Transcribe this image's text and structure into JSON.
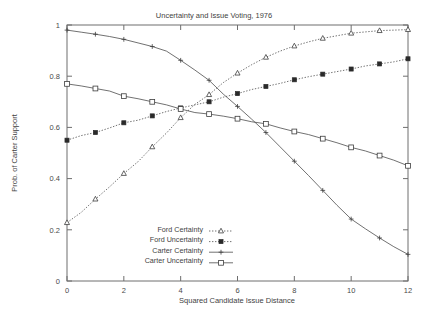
{
  "chart_data": {
    "type": "line",
    "title": "Uncertainty and Issue Voting, 1976",
    "xlabel": "Squared Candidate Issue Distance",
    "ylabel": "Prob. of Carter Support",
    "xlim": [
      0,
      12
    ],
    "ylim": [
      0,
      1
    ],
    "xticks": [
      0,
      2,
      4,
      6,
      8,
      10,
      12
    ],
    "xticklabels": [
      "0",
      "2",
      "4",
      "6",
      "8",
      "10",
      "12"
    ],
    "yticks": [
      0,
      0.2,
      0.4,
      0.6,
      0.8,
      1
    ],
    "yticklabels": [
      "0",
      "0.2",
      "0.4",
      "0.6",
      "0.8",
      "1"
    ],
    "grid": false,
    "legend_position": "lower-center-left",
    "x": [
      0,
      0.5,
      1,
      1.5,
      2,
      2.5,
      3,
      3.5,
      4,
      4.5,
      5,
      5.5,
      6,
      6.5,
      7,
      7.5,
      8,
      8.5,
      9,
      9.5,
      10,
      10.5,
      11,
      11.5,
      12
    ],
    "series": [
      {
        "name": "Ford Certainty",
        "marker": "open-triangle",
        "linestyle": "dotted",
        "values": [
          0.228,
          0.268,
          0.32,
          0.368,
          0.42,
          0.466,
          0.524,
          0.578,
          0.638,
          0.69,
          0.728,
          0.775,
          0.812,
          0.845,
          0.874,
          0.898,
          0.918,
          0.934,
          0.948,
          0.958,
          0.968,
          0.973,
          0.978,
          0.98,
          0.982
        ]
      },
      {
        "name": "Ford Uncertainty",
        "marker": "filled-square",
        "linestyle": "dotted",
        "values": [
          0.55,
          0.568,
          0.58,
          0.598,
          0.618,
          0.628,
          0.645,
          0.662,
          0.676,
          0.688,
          0.7,
          0.718,
          0.732,
          0.748,
          0.76,
          0.772,
          0.786,
          0.798,
          0.808,
          0.818,
          0.828,
          0.84,
          0.848,
          0.856,
          0.868
        ]
      },
      {
        "name": "Carter Certainty",
        "marker": "plus",
        "linestyle": "solid",
        "values": [
          0.98,
          0.972,
          0.964,
          0.955,
          0.944,
          0.93,
          0.916,
          0.898,
          0.862,
          0.824,
          0.784,
          0.73,
          0.682,
          0.632,
          0.58,
          0.524,
          0.468,
          0.412,
          0.354,
          0.296,
          0.242,
          0.204,
          0.168,
          0.134,
          0.104
        ]
      },
      {
        "name": "Carter Uncertainty",
        "marker": "open-square",
        "linestyle": "solid",
        "values": [
          0.77,
          0.762,
          0.752,
          0.742,
          0.722,
          0.712,
          0.7,
          0.688,
          0.672,
          0.658,
          0.652,
          0.644,
          0.634,
          0.622,
          0.614,
          0.598,
          0.584,
          0.572,
          0.556,
          0.54,
          0.522,
          0.508,
          0.49,
          0.472,
          0.45
        ]
      }
    ]
  },
  "legend": {
    "entries": [
      {
        "label": "Ford Certainty"
      },
      {
        "label": "Ford Uncertainty"
      },
      {
        "label": "Carter Certainty"
      },
      {
        "label": "Carter Uncertainty"
      }
    ]
  },
  "colors": {
    "axis": "#6e6e6e",
    "ink": "#3d3d3d",
    "background": "#ffffff"
  }
}
